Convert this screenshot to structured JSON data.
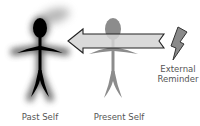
{
  "diagram": {
    "figures": [
      {
        "id": "past-self",
        "label": "Past Self",
        "color": "#000000",
        "glow": "#6b6b6b"
      },
      {
        "id": "present-self",
        "label": "Present Self",
        "color": "#8c8c8c"
      }
    ],
    "arrow": {
      "direction": "left",
      "fill": "#d4d4d4",
      "stroke": "#222222"
    },
    "reminder": {
      "icon": "lightning-bolt-icon",
      "label_line1": "External",
      "label_line2": "Reminder",
      "fill": "#8a8a8a"
    }
  }
}
